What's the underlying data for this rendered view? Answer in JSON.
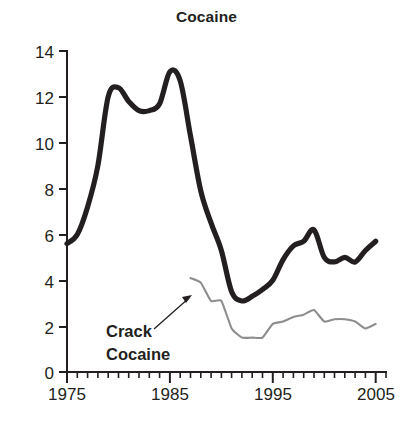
{
  "chart_data": {
    "type": "line",
    "title": "Cocaine",
    "xlabel": "",
    "ylabel": "",
    "xlim": [
      1975,
      2006
    ],
    "ylim": [
      0,
      14
    ],
    "grid": false,
    "legend_position": "inline-annotation",
    "y_ticks": [
      0,
      2,
      4,
      6,
      8,
      10,
      12,
      14
    ],
    "y_tick_labels": [
      "0",
      "2",
      "4",
      "6",
      "8",
      "10",
      "12",
      "14"
    ],
    "x_ticks": [
      1975,
      1985,
      1995,
      2005
    ],
    "x_tick_labels": [
      "1975",
      "1985",
      "1995",
      "2005"
    ],
    "x_minor_tick_interval": 1,
    "annotations": [
      {
        "text": "Crack\nCocaine",
        "line1": "Crack",
        "line2": "Cocaine",
        "points_to_year": 1988,
        "points_to_value": 2.9,
        "style": "arrow"
      }
    ],
    "series": [
      {
        "name": "Cocaine",
        "color": "#231f20",
        "line_width": "thick",
        "x": [
          1975,
          1976,
          1977,
          1978,
          1979,
          1980,
          1981,
          1982,
          1983,
          1984,
          1985,
          1986,
          1987,
          1988,
          1989,
          1990,
          1991,
          1992,
          1993,
          1994,
          1995,
          1996,
          1997,
          1998,
          1999,
          2000,
          2001,
          2002,
          2003,
          2004,
          2005
        ],
        "values": [
          5.6,
          6.0,
          7.2,
          9.0,
          12.0,
          12.4,
          11.8,
          11.4,
          11.4,
          11.7,
          13.1,
          12.7,
          10.3,
          7.9,
          6.5,
          5.3,
          3.5,
          3.1,
          3.3,
          3.6,
          4.0,
          4.9,
          5.5,
          5.7,
          6.2,
          5.0,
          4.8,
          5.0,
          4.8,
          5.3,
          5.7
        ]
      },
      {
        "name": "Crack Cocaine",
        "color": "#8d8d8d",
        "line_width": "thin",
        "x": [
          1987,
          1988,
          1989,
          1990,
          1991,
          1992,
          1993,
          1994,
          1995,
          1996,
          1997,
          1998,
          1999,
          2000,
          2001,
          2002,
          2003,
          2004,
          2005
        ],
        "values": [
          4.1,
          3.9,
          3.1,
          3.1,
          1.9,
          1.5,
          1.5,
          1.5,
          2.1,
          2.2,
          2.4,
          2.5,
          2.7,
          2.2,
          2.3,
          2.3,
          2.2,
          1.9,
          2.1
        ]
      }
    ]
  },
  "axis": {
    "y_axis_name": "y-axis",
    "x_axis_name": "x-axis"
  }
}
